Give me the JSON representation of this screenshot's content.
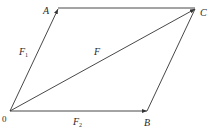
{
  "diagram": {
    "points": {
      "O": {
        "label": "0",
        "x": 10,
        "y": 111
      },
      "A": {
        "label": "A",
        "x": 58,
        "y": 8
      },
      "B": {
        "label": "B",
        "x": 147,
        "y": 111
      },
      "C": {
        "label": "C",
        "x": 195,
        "y": 9
      }
    },
    "vectors": [
      {
        "name": "F1",
        "label": "F",
        "subscript": "1",
        "from": "O",
        "to": "A"
      },
      {
        "name": "F2",
        "label": "F",
        "subscript": "2",
        "from": "O",
        "to": "B"
      },
      {
        "name": "F",
        "label": "F",
        "subscript": "",
        "from": "O",
        "to": "C"
      }
    ],
    "edges": [
      {
        "from": "A",
        "to": "C"
      },
      {
        "from": "B",
        "to": "C"
      }
    ],
    "line_color": "#333333"
  }
}
